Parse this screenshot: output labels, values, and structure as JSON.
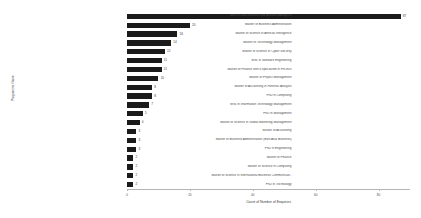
{
  "chart_data": {
    "type": "bar",
    "orientation": "horizontal",
    "title": "",
    "xlabel": "Count of Number of Enquiries",
    "ylabel": "Programme Name",
    "xlim": [
      0,
      90
    ],
    "xticks": [
      0,
      20,
      40,
      60,
      80
    ],
    "xtick_labels": [
      "0",
      "20",
      "40",
      "60",
      "80"
    ],
    "grid": false,
    "legend": null,
    "bar_color": "#1b1b1b",
    "categories": [
      "MSc in Data Science and Business Analytics",
      "Master of Business Administration",
      "Master of Science in Artificial Intelligence",
      "Master of Technology Management",
      "Master of Science in Cyber Security",
      "MSc in Software Engineering",
      "Master of Finance with a specialism in FinTech",
      "Master of Project Management",
      "Master of Accounting in Forensic Analysis",
      "PhD in Computing",
      "MSc in Information Technology Management",
      "PhD in Management",
      "Master of Science in Global Marketing Management",
      "Master of Accounting",
      "Master of Business Administration (East Asia Business)",
      "PhD in Engineering",
      "Master of Finance",
      "Master of Science in Computing",
      "Master of Science in International Business Communicati..",
      "PhD in Technology"
    ],
    "values": [
      87,
      20,
      16,
      14,
      12,
      11,
      11,
      10,
      8,
      8,
      7,
      5,
      4,
      3,
      3,
      3,
      2,
      2,
      2,
      2
    ],
    "value_labels": [
      "87",
      "20",
      "16",
      "14",
      "12",
      "11",
      "11",
      "10",
      "8",
      "8",
      "7",
      "5",
      "4",
      "3",
      "3",
      "3",
      "2",
      "2",
      "2",
      "2"
    ]
  }
}
